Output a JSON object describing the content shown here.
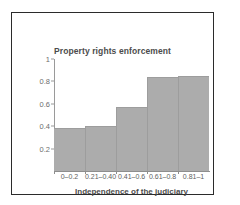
{
  "chart_data": {
    "type": "bar",
    "title": "Property rights enforcement",
    "xlabel": "Independence of the judiciary",
    "ylabel": "",
    "categories": [
      "0–0.2",
      "0.21–0.40",
      "0.41–0.6",
      "0.61–0.8",
      "0.81–1"
    ],
    "values": [
      0.38,
      0.4,
      0.57,
      0.84,
      0.85
    ],
    "ylim": [
      0,
      1
    ],
    "yticks": [
      "0.2",
      "0.4",
      "0.6",
      "0.8",
      "1"
    ],
    "ytick_values": [
      0.2,
      0.4,
      0.6,
      0.8,
      1
    ],
    "grid": false,
    "legend": null,
    "bar_color": "#acacac",
    "frame_color": "#2b2b2b",
    "axis_color": "#8e8e8e"
  },
  "figure": {
    "border_visible": true
  }
}
